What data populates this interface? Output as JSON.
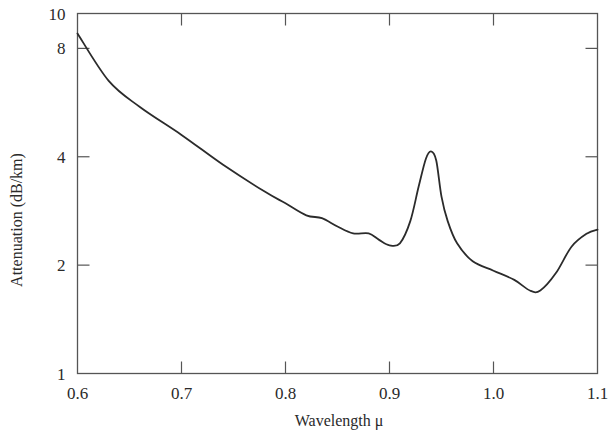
{
  "chart_data": {
    "type": "line",
    "title": "",
    "xlabel": "Wavelength μ",
    "ylabel": "Attenuation (dB/km)",
    "xlim": [
      0.6,
      1.1
    ],
    "ylim": [
      1,
      10
    ],
    "yscale": "log",
    "grid": false,
    "legend": null,
    "x_ticks": [
      "0.6",
      "0.7",
      "0.8",
      "0.9",
      "1.0",
      "1.1"
    ],
    "y_ticks": [
      "1",
      "2",
      "4",
      "8",
      "10"
    ],
    "series": [
      {
        "name": "Attenuation",
        "x": [
          0.6,
          0.63,
          0.66,
          0.7,
          0.74,
          0.78,
          0.8,
          0.82,
          0.835,
          0.85,
          0.865,
          0.88,
          0.89,
          0.9,
          0.91,
          0.92,
          0.928,
          0.935,
          0.94,
          0.945,
          0.95,
          0.956,
          0.965,
          0.98,
          1.0,
          1.02,
          1.035,
          1.045,
          1.06,
          1.075,
          1.09,
          1.1
        ],
        "values": [
          8.8,
          6.5,
          5.5,
          4.6,
          3.8,
          3.2,
          2.97,
          2.75,
          2.7,
          2.56,
          2.45,
          2.45,
          2.35,
          2.27,
          2.3,
          2.65,
          3.3,
          3.95,
          4.14,
          3.9,
          3.1,
          2.65,
          2.3,
          2.05,
          1.93,
          1.82,
          1.7,
          1.7,
          1.9,
          2.25,
          2.45,
          2.51
        ]
      }
    ]
  }
}
